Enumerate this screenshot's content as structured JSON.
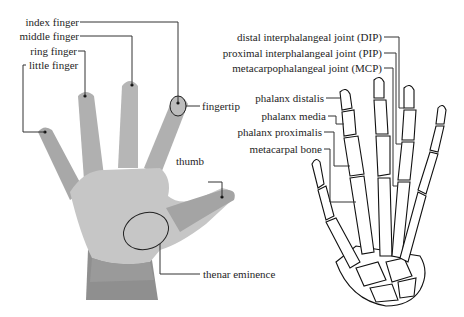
{
  "diagram": {
    "left_panel": {
      "subject": "hand (palm view)",
      "labels": [
        {
          "id": "index",
          "text": "index finger"
        },
        {
          "id": "middle",
          "text": "middle finger"
        },
        {
          "id": "ring",
          "text": "ring finger"
        },
        {
          "id": "little",
          "text": "little finger"
        },
        {
          "id": "fingertip",
          "text": "fingertip"
        },
        {
          "id": "thumb",
          "text": "thumb"
        },
        {
          "id": "thenar",
          "text": "thenar eminence"
        }
      ]
    },
    "right_panel": {
      "subject": "hand skeleton",
      "labels": [
        {
          "id": "dip",
          "text": "distal interphalangeal joint (DIP)"
        },
        {
          "id": "pip",
          "text": "proximal interphalangeal joint (PIP)"
        },
        {
          "id": "mcp",
          "text": "metacarpophalangeal joint (MCP)"
        },
        {
          "id": "distalis",
          "text": "phalanx distalis"
        },
        {
          "id": "media",
          "text": "phalanx media"
        },
        {
          "id": "proximalis",
          "text": "phalanx proximalis"
        },
        {
          "id": "metacarpal",
          "text": "metacarpal bone"
        }
      ]
    },
    "colors": {
      "hand_light": "#c4c4c4",
      "hand_dark": "#9a9a9a",
      "leader_line": "#333333",
      "bone_outline": "#111111"
    }
  }
}
